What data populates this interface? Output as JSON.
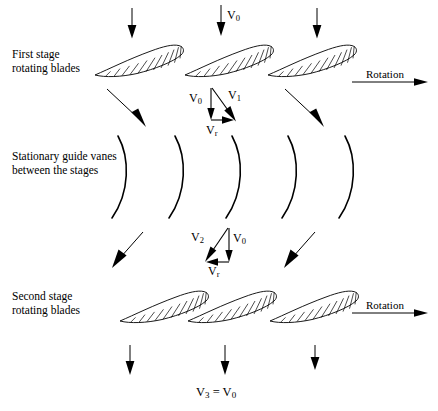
{
  "figure": {
    "type": "diagram",
    "width": 438,
    "height": 411,
    "background_color": "#ffffff",
    "line_color": "#000000"
  },
  "labels": {
    "first_stage_line1": "First stage",
    "first_stage_line2": "rotating blades",
    "guide_vanes_line1": "Stationary guide vanes",
    "guide_vanes_line2": "between the stages",
    "second_stage_line1": "Second stage",
    "second_stage_line2": "rotating blades",
    "rotation_top": "Rotation",
    "rotation_bottom": "Rotation"
  },
  "velocities": {
    "inlet": {
      "symbol": "V",
      "sub": "0",
      "text": "V0"
    },
    "triangle_one": {
      "axial": {
        "symbol": "V",
        "sub": "0",
        "text": "V0"
      },
      "relative": {
        "symbol": "V",
        "sub": "1",
        "text": "V1"
      },
      "tangential": {
        "symbol": "V",
        "sub": "r",
        "text": "Vr"
      }
    },
    "triangle_two": {
      "absolute": {
        "symbol": "V",
        "sub": "2",
        "text": "V2"
      },
      "axial": {
        "symbol": "V",
        "sub": "0",
        "text": "V0"
      },
      "tangential": {
        "symbol": "V",
        "sub": "r",
        "text": "Vr"
      }
    },
    "outlet": {
      "left_symbol": "V",
      "left_sub": "3",
      "equals": " = ",
      "right_symbol": "V",
      "right_sub": "0",
      "text": "V3 = V0"
    }
  },
  "geometry": {
    "inlet_arrows_x": [
      132,
      221,
      317
    ],
    "outlet_arrows_x": [
      130,
      225,
      315
    ],
    "first_stage_blades_x": [
      95,
      185,
      268
    ],
    "second_stage_blades_x": [
      120,
      188,
      270
    ],
    "guide_vanes_x": [
      123,
      180,
      237,
      293,
      350
    ],
    "guide_vane_y_top": 136,
    "guide_vane_y_bottom": 218,
    "rotation_arrow_top_y": 82,
    "rotation_arrow_bottom_y": 313
  },
  "counts": {
    "first_stage_blades": 3,
    "second_stage_blades": 3,
    "guide_vanes": 5,
    "inlet_arrows": 3,
    "outlet_arrows": 3,
    "velocity_triangles": 2
  }
}
